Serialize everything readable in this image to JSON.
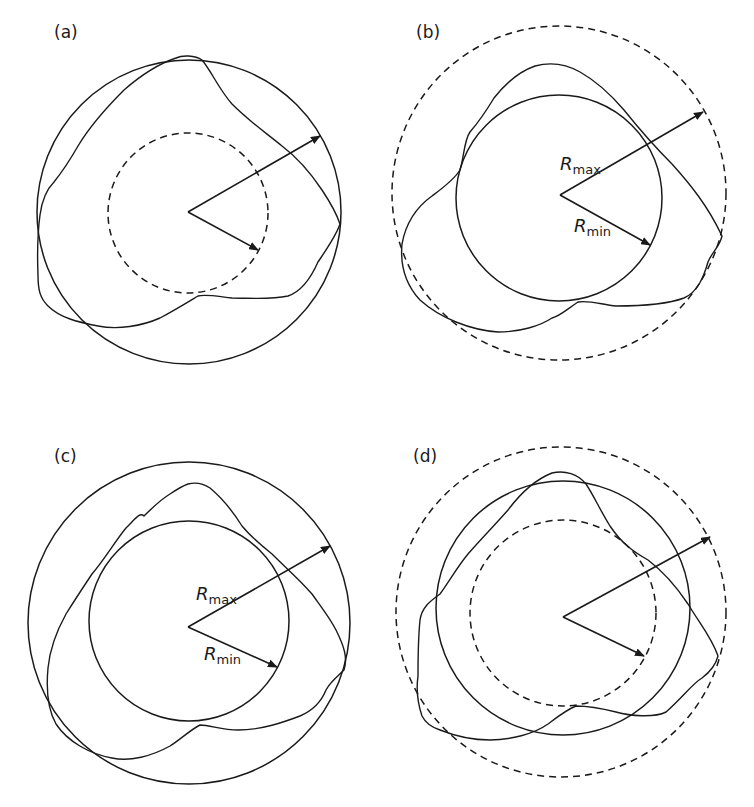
{
  "figure": {
    "panels": [
      {
        "id": "a",
        "label": "(a)",
        "reference_circles": [
          "outer solid circumscribed circle",
          "inner dashed circle"
        ],
        "radius_labels": {
          "max": "",
          "min": ""
        }
      },
      {
        "id": "b",
        "label": "(b)",
        "reference_circles": [
          "outer dashed circle",
          "inner solid inscribed circle"
        ],
        "radius_labels": {
          "max_main": "R",
          "max_sub": "max",
          "min_main": "R",
          "min_sub": "min"
        }
      },
      {
        "id": "c",
        "label": "(c)",
        "reference_circles": [
          "outer solid circle",
          "inner solid circle"
        ],
        "radius_labels": {
          "max_main": "R",
          "max_sub": "max",
          "min_main": "R",
          "min_sub": "min"
        }
      },
      {
        "id": "d",
        "label": "(d)",
        "reference_circles": [
          "outer dashed circle",
          "middle solid circle",
          "inner dashed circle"
        ],
        "radius_labels": {
          "max": "",
          "min": ""
        }
      }
    ],
    "colors": {
      "stroke": "#1a1a1a",
      "background": "#ffffff"
    }
  }
}
